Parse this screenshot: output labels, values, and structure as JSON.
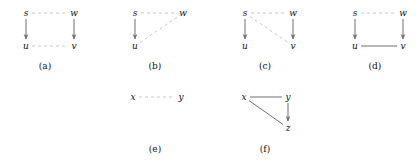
{
  "figure": {
    "width": 419,
    "height": 165,
    "background": "#ffffff",
    "styles": {
      "dashed_color": "#c9c9c9",
      "solid_color": "#6f6f6f",
      "arrow_color": "#6f6f6f",
      "label_color": "#111111",
      "dash_pattern": "3,3",
      "line_width": 1
    },
    "panels": [
      {
        "id": "panel-a",
        "caption": "(a)",
        "caption_pos": {
          "x": 45,
          "y": 66
        },
        "nodes": [
          {
            "id": "s",
            "label": "s",
            "x": 26,
            "y": 13
          },
          {
            "id": "w",
            "label": "w",
            "x": 74,
            "y": 13
          },
          {
            "id": "u",
            "label": "u",
            "x": 26,
            "y": 46
          },
          {
            "id": "v",
            "label": "v",
            "x": 74,
            "y": 46
          }
        ],
        "edges": [
          {
            "id": "s-w",
            "from": "s",
            "to": "w",
            "style": "dashed",
            "arrow": false
          },
          {
            "id": "u-v",
            "from": "u",
            "to": "v",
            "style": "dashed",
            "arrow": false
          },
          {
            "id": "s-u",
            "from": "s",
            "to": "u",
            "style": "solid",
            "arrow": true
          },
          {
            "id": "w-v",
            "from": "w",
            "to": "v",
            "style": "solid",
            "arrow": true
          }
        ]
      },
      {
        "id": "panel-b",
        "caption": "(b)",
        "caption_pos": {
          "x": 155,
          "y": 66
        },
        "nodes": [
          {
            "id": "s",
            "label": "s",
            "x": 135,
            "y": 13
          },
          {
            "id": "w",
            "label": "w",
            "x": 183,
            "y": 13
          },
          {
            "id": "u",
            "label": "u",
            "x": 135,
            "y": 46
          }
        ],
        "edges": [
          {
            "id": "s-w",
            "from": "s",
            "to": "w",
            "style": "dashed",
            "arrow": false
          },
          {
            "id": "u-w",
            "from": "u",
            "to": "w",
            "style": "dashed",
            "arrow": false
          },
          {
            "id": "s-u",
            "from": "s",
            "to": "u",
            "style": "solid",
            "arrow": true
          }
        ]
      },
      {
        "id": "panel-c",
        "caption": "(c)",
        "caption_pos": {
          "x": 265,
          "y": 66
        },
        "nodes": [
          {
            "id": "s",
            "label": "s",
            "x": 245,
            "y": 13
          },
          {
            "id": "w",
            "label": "w",
            "x": 293,
            "y": 13
          },
          {
            "id": "u",
            "label": "u",
            "x": 245,
            "y": 46
          },
          {
            "id": "v",
            "label": "v",
            "x": 293,
            "y": 46
          }
        ],
        "edges": [
          {
            "id": "s-w",
            "from": "s",
            "to": "w",
            "style": "dashed",
            "arrow": false
          },
          {
            "id": "s-v",
            "from": "s",
            "to": "v",
            "style": "dashed",
            "arrow": false
          },
          {
            "id": "s-u",
            "from": "s",
            "to": "u",
            "style": "solid",
            "arrow": true
          },
          {
            "id": "w-v",
            "from": "w",
            "to": "v",
            "style": "solid",
            "arrow": true
          }
        ]
      },
      {
        "id": "panel-d",
        "caption": "(d)",
        "caption_pos": {
          "x": 375,
          "y": 66
        },
        "nodes": [
          {
            "id": "s",
            "label": "s",
            "x": 355,
            "y": 13
          },
          {
            "id": "w",
            "label": "w",
            "x": 403,
            "y": 13
          },
          {
            "id": "u",
            "label": "u",
            "x": 355,
            "y": 46
          },
          {
            "id": "v",
            "label": "v",
            "x": 403,
            "y": 46
          }
        ],
        "edges": [
          {
            "id": "s-w",
            "from": "s",
            "to": "w",
            "style": "dashed",
            "arrow": false
          },
          {
            "id": "u-v",
            "from": "u",
            "to": "v",
            "style": "solid",
            "arrow": false
          },
          {
            "id": "s-u",
            "from": "s",
            "to": "u",
            "style": "solid",
            "arrow": true
          },
          {
            "id": "w-v",
            "from": "w",
            "to": "v",
            "style": "solid",
            "arrow": true
          }
        ]
      },
      {
        "id": "panel-e",
        "caption": "(e)",
        "caption_pos": {
          "x": 155,
          "y": 149
        },
        "nodes": [
          {
            "id": "x",
            "label": "x",
            "x": 133,
            "y": 97
          },
          {
            "id": "y",
            "label": "y",
            "x": 181,
            "y": 97
          }
        ],
        "edges": [
          {
            "id": "x-y",
            "from": "x",
            "to": "y",
            "style": "dashed",
            "arrow": false
          }
        ]
      },
      {
        "id": "panel-f",
        "caption": "(f)",
        "caption_pos": {
          "x": 265,
          "y": 149
        },
        "nodes": [
          {
            "id": "x",
            "label": "x",
            "x": 244,
            "y": 97
          },
          {
            "id": "y",
            "label": "y",
            "x": 288,
            "y": 97
          },
          {
            "id": "z",
            "label": "z",
            "x": 288,
            "y": 128
          }
        ],
        "edges": [
          {
            "id": "x-y",
            "from": "x",
            "to": "y",
            "style": "solid",
            "arrow": false
          },
          {
            "id": "x-z",
            "from": "x",
            "to": "z",
            "style": "solid",
            "arrow": false
          },
          {
            "id": "y-z",
            "from": "y",
            "to": "z",
            "style": "solid",
            "arrow": true
          }
        ]
      }
    ]
  }
}
